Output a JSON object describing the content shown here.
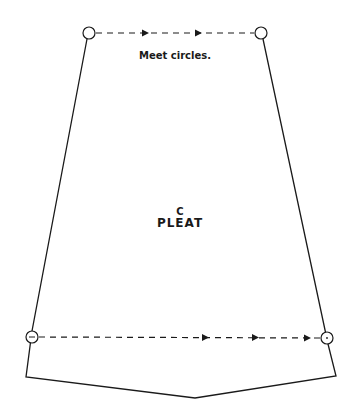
{
  "diagram": {
    "type": "sewing-pattern-piece",
    "instruction_note": "Meet circles.",
    "piece_letter": "C",
    "piece_name": "PLEAT",
    "colors": {
      "line": "#1a1a1a",
      "background": "#ffffff"
    },
    "outline_points": [
      [
        89,
        33
      ],
      [
        32,
        337
      ],
      [
        26,
        377
      ],
      [
        195,
        398
      ],
      [
        336,
        376
      ],
      [
        327,
        338
      ],
      [
        261,
        33
      ]
    ],
    "markers": {
      "circles": [
        {
          "id": "top-left",
          "cx": 89,
          "cy": 33,
          "r": 6
        },
        {
          "id": "top-right",
          "cx": 261,
          "cy": 33,
          "r": 6
        },
        {
          "id": "bottom-left",
          "cx": 32,
          "cy": 337,
          "r": 6
        },
        {
          "id": "bottom-right",
          "cx": 327,
          "cy": 338,
          "r": 6
        }
      ],
      "fold_lines": [
        {
          "id": "top-dashed",
          "from": [
            95,
            33
          ],
          "to": [
            255,
            33
          ],
          "arrows_x": [
            146,
            199
          ]
        },
        {
          "id": "bottom-dashed",
          "from": [
            38,
            337
          ],
          "to": [
            321,
            338
          ],
          "arrows_x": [
            206,
            256,
            308
          ]
        }
      ]
    }
  }
}
